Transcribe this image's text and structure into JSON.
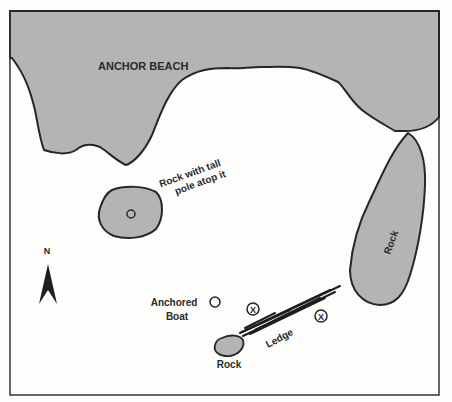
{
  "map": {
    "labels": {
      "beach": "ANCHOR BEACH",
      "pole_rock_line1": "Rock with tall",
      "pole_rock_line2": "pole atop it",
      "east_rock": "Rock",
      "boat_line1": "Anchored",
      "boat_line2": "Boat",
      "south_rock": "Rock",
      "ledge": "Ledge",
      "north": "N",
      "marker_x": "X"
    },
    "colors": {
      "land": "#b4b4b4",
      "outline": "#262626",
      "water": "#fdfdfb"
    }
  }
}
